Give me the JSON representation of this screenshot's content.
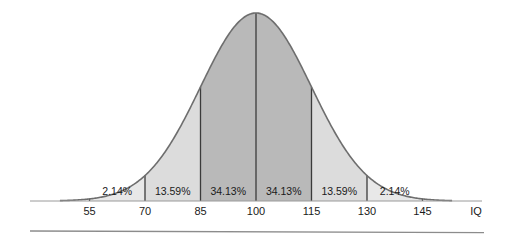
{
  "chart_data": {
    "type": "area",
    "title": "",
    "subtitle": "",
    "xlabel": "IQ",
    "ylabel": "",
    "distribution": "normal",
    "mean": 100,
    "std_dev": 15,
    "xlim": [
      47,
      153
    ],
    "grid": false,
    "legend": null,
    "x_ticks": [
      {
        "value": 55,
        "label": "55"
      },
      {
        "value": 70,
        "label": "70"
      },
      {
        "value": 85,
        "label": "85"
      },
      {
        "value": 100,
        "label": "100"
      },
      {
        "value": 115,
        "label": "115"
      },
      {
        "value": 130,
        "label": "130"
      },
      {
        "value": 145,
        "label": "145"
      }
    ],
    "bands": [
      {
        "from": 55,
        "to": 70,
        "label": "2.14%",
        "value": 2.14,
        "fill": "#e8e8e8"
      },
      {
        "from": 70,
        "to": 85,
        "label": "13.59%",
        "value": 13.59,
        "fill": "#dcdcdc"
      },
      {
        "from": 85,
        "to": 100,
        "label": "34.13%",
        "value": 34.13,
        "fill": "#b9b9b9"
      },
      {
        "from": 100,
        "to": 115,
        "label": "34.13%",
        "value": 34.13,
        "fill": "#b9b9b9"
      },
      {
        "from": 115,
        "to": 130,
        "label": "13.59%",
        "value": 13.59,
        "fill": "#dcdcdc"
      },
      {
        "from": 130,
        "to": 145,
        "label": "2.14%",
        "value": 2.14,
        "fill": "#e8e8e8"
      }
    ],
    "annotations": [
      "2.14%",
      "13.59%",
      "34.13%",
      "34.13%",
      "13.59%",
      "2.14%"
    ],
    "colors": {
      "curve_stroke": "#6e6e6e",
      "divider_stroke": "#3b3b3b",
      "axis_stroke": "#9a9a9a",
      "band_inner": "#b9b9b9",
      "band_mid": "#dcdcdc",
      "band_outer": "#e8e8e8",
      "text": "#1a1a1a",
      "rule": "#8c8c8c",
      "background": "#ffffff"
    }
  },
  "axis": {
    "x_label": "IQ",
    "tick_labels": [
      "55",
      "70",
      "85",
      "100",
      "115",
      "130",
      "145"
    ]
  },
  "band_labels": [
    "2.14%",
    "13.59%",
    "34.13%",
    "34.13%",
    "13.59%",
    "2.14%"
  ],
  "footer": {
    "rule_visible": "true"
  }
}
